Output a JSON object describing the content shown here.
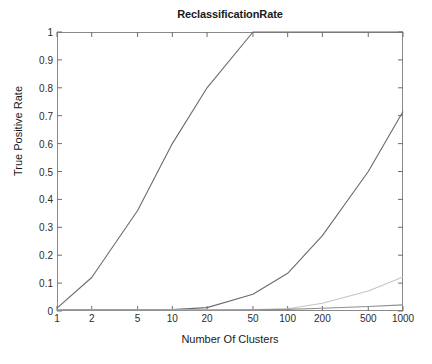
{
  "chart_data": {
    "type": "line",
    "title": "ReclassificationRate",
    "xlabel": "Number Of Clusters",
    "ylabel": "True Positive Rate",
    "xscale": "log",
    "xlim": [
      1,
      1000
    ],
    "ylim": [
      0,
      1
    ],
    "grid": false,
    "legend": "none",
    "xticks": [
      1,
      2,
      5,
      10,
      20,
      50,
      100,
      200,
      500,
      1000
    ],
    "xtick_labels": [
      "1",
      "2",
      "5",
      "10",
      "20",
      "50",
      "100",
      "200",
      "500",
      "1000"
    ],
    "yticks": [
      0,
      0.1,
      0.2,
      0.3,
      0.4,
      0.5,
      0.6,
      0.7,
      0.8,
      0.9,
      1
    ],
    "ytick_labels": [
      "0",
      "0.1",
      "0.2",
      "0.3",
      "0.4",
      "0.5",
      "0.6",
      "0.7",
      "0.8",
      "0.9",
      "1"
    ],
    "x": [
      1,
      2,
      5,
      10,
      20,
      50,
      100,
      200,
      500,
      1000
    ],
    "series": [
      {
        "name": "series-1",
        "color": "#6b6b6b",
        "values": [
          0.01,
          0.12,
          0.36,
          0.6,
          0.8,
          1.0,
          1.0,
          1.0,
          1.0,
          1.0
        ]
      },
      {
        "name": "series-2",
        "color": "#6b6b6b",
        "values": [
          0.005,
          0.005,
          0.005,
          0.005,
          0.012,
          0.06,
          0.135,
          0.27,
          0.5,
          0.715
        ]
      },
      {
        "name": "series-3",
        "color": "#c4c4c4",
        "values": [
          0.004,
          0.004,
          0.004,
          0.004,
          0.004,
          0.005,
          0.008,
          0.028,
          0.072,
          0.122
        ]
      },
      {
        "name": "series-4",
        "color": "#8f8f8f",
        "values": [
          0.003,
          0.003,
          0.003,
          0.003,
          0.003,
          0.004,
          0.006,
          0.01,
          0.016,
          0.022
        ]
      }
    ]
  },
  "axes": {
    "frame_color": "#8a8a8a",
    "tick_color": "#6e6e6e",
    "text_color": "#2b2b2b"
  }
}
